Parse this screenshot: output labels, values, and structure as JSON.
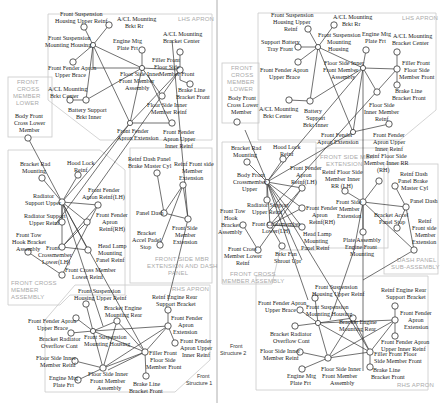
{
  "diagrams": [
    {
      "caption": [
        "Front",
        "Structure 1"
      ],
      "regions": {
        "lhs_apron": [
          "LHS APRON"
        ],
        "front_cross_member_lower": [
          "FRONT",
          "CROSS",
          "MEMBER",
          "LOWER"
        ],
        "front_cross_member_assembly": [
          "FRONT CROSS",
          "MEMBER",
          "ASSEMBLY"
        ],
        "front_side_mbr_ext_dash": [
          "FRONT SIDE MBR",
          "EXTENSION AND DASH",
          "PANEL"
        ],
        "rhs_apron": [
          "RHS APRON"
        ]
      },
      "nodes": [
        {
          "id": "a1",
          "label": [
            "Front Suspension",
            "Housing Upper Reinf"
          ]
        },
        {
          "id": "a2",
          "label": [
            "A/CL Mounting",
            "Brkt Rr"
          ]
        },
        {
          "id": "a3",
          "label": [
            "Front Suspension",
            "Mounting Housing"
          ]
        },
        {
          "id": "a4",
          "label": [
            "Engine Mtg",
            "Plate Frt"
          ]
        },
        {
          "id": "a5",
          "label": [
            "A/CL Mounting",
            "Bracket Center"
          ]
        },
        {
          "id": "a6",
          "label": [
            "Front Fender Apron",
            "Upper Brace"
          ]
        },
        {
          "id": "a7",
          "label": [
            "Filler Front",
            "Floor Side",
            "Member Front"
          ]
        },
        {
          "id": "a8",
          "label": [
            "Floor Side Inner",
            "Front Member",
            "Assembly"
          ]
        },
        {
          "id": "a9",
          "label": [
            "Brake Line",
            "Bracket Front"
          ]
        },
        {
          "id": "a10",
          "label": [
            "A/CL Mounting",
            "Brkt Center"
          ]
        },
        {
          "id": "a11",
          "label": [
            "Battery Support",
            "Brkt Inner"
          ]
        },
        {
          "id": "a12",
          "label": [
            "Floor Side Inner",
            "Member Reinf"
          ]
        },
        {
          "id": "a13",
          "label": [
            "Front Fender",
            "Apron Extension"
          ]
        },
        {
          "id": "a14",
          "label": [
            "Front Fender",
            "Apron Upper",
            "Inner Reinf"
          ]
        },
        {
          "id": "b1",
          "label": [
            "Body Front",
            "Cross Lower",
            "Member"
          ]
        },
        {
          "id": "c1",
          "label": [
            "Bracket Rad",
            "Mounting"
          ]
        },
        {
          "id": "c2",
          "label": [
            "Hood Lock",
            "Reinf"
          ]
        },
        {
          "id": "c3",
          "label": [
            "Radiator",
            "Support Upper"
          ]
        },
        {
          "id": "c4",
          "label": [
            "Front Fender",
            "Apron Reinf(LH)"
          ]
        },
        {
          "id": "c5",
          "label": [
            "Radiator Support",
            "Upper Reinf"
          ]
        },
        {
          "id": "c6",
          "label": [
            "Front Fender",
            "Apron",
            "Reinf(RH)"
          ]
        },
        {
          "id": "c7",
          "label": [
            "Front Tow",
            "Hook Bracket",
            "Assembly"
          ]
        },
        {
          "id": "c8",
          "label": [
            "Front",
            "Crossmember",
            "Lower(LH)"
          ]
        },
        {
          "id": "c9",
          "label": [
            "Head Lamp",
            "Mounting",
            "Panel Reinf"
          ]
        },
        {
          "id": "c10",
          "label": [
            "Front Cross Member",
            "Lower Reinf"
          ]
        },
        {
          "id": "d1",
          "label": [
            "Reinf Dash Panel",
            "Brake Master Cyl"
          ]
        },
        {
          "id": "d2",
          "label": [
            "Reinf Front side",
            "Member",
            "Extension"
          ]
        },
        {
          "id": "d3",
          "label": [
            "Panel Dash"
          ]
        },
        {
          "id": "d4",
          "label": [
            "Front Side",
            "Member",
            "Extension"
          ]
        },
        {
          "id": "d5",
          "label": [
            "Bracket",
            "Accel Padel",
            "Stop"
          ]
        },
        {
          "id": "e1",
          "label": [
            "Front Suspension",
            "Housing Upper Reinf"
          ]
        },
        {
          "id": "e2",
          "label": [
            "Reinf Engine Rear",
            "Support Bracket"
          ]
        },
        {
          "id": "e3",
          "label": [
            "Bracket Engine",
            "Mounting Rear"
          ]
        },
        {
          "id": "e4",
          "label": [
            "Front Fender Apron",
            "Upper Brace"
          ]
        },
        {
          "id": "e5",
          "label": [
            "Front Fender",
            "Apron",
            "Extension"
          ]
        },
        {
          "id": "e6",
          "label": [
            "Front Suspension",
            "Mounting Housing"
          ]
        },
        {
          "id": "e7",
          "label": [
            "Bracket Radiator",
            "Overflow Cont"
          ]
        },
        {
          "id": "e8",
          "label": [
            "Front Fender",
            "Apron Upper",
            "Inner Reinf"
          ]
        },
        {
          "id": "e9",
          "label": [
            "Floor Side Inner",
            "Member Reinf"
          ]
        },
        {
          "id": "e10",
          "label": [
            "Filler Front",
            "Floor Side",
            "Member Front"
          ]
        },
        {
          "id": "e11",
          "label": [
            "Engine Mtg",
            "Plate Frt"
          ]
        },
        {
          "id": "e12",
          "label": [
            "Floor Side Inner",
            "Front Member",
            "Assembly"
          ]
        },
        {
          "id": "e13",
          "label": [
            "Brake Line",
            "Bracket Front"
          ]
        }
      ]
    },
    {
      "caption": [
        "Front",
        "Structure 2"
      ],
      "regions": {
        "lhs_apron": [
          "LHS APRON"
        ],
        "front_cross_member_lower": [
          "FRONT",
          "CROSS",
          "MEMBER",
          "LOWER"
        ],
        "front_side_mbr_extension": [
          "FRONT SIDE MBR",
          "EXTENSION"
        ],
        "dash_panel_subassembly": [
          "DASH PANEL",
          "SUB-ASSEMBLY"
        ],
        "front_cross_member_assembly": [
          "FRONT CROSS",
          "MEMBER ASSEMBLY"
        ],
        "rhs_apron": [
          "RHS APRON"
        ]
      },
      "nodes": [
        {
          "id": "A1",
          "label": [
            "Front Suspension",
            "Housing Upper",
            "Reinf"
          ]
        },
        {
          "id": "A2",
          "label": [
            "A/CL Mounting",
            "Brkt Rr"
          ]
        },
        {
          "id": "A3",
          "label": [
            "Support Battery",
            "Tray Front"
          ]
        },
        {
          "id": "A4",
          "label": [
            "Front Suspension",
            "Mounting",
            "Housing"
          ]
        },
        {
          "id": "A5",
          "label": [
            "Engine Mtg",
            "Plate Frt"
          ]
        },
        {
          "id": "A6",
          "label": [
            "A/CL Mounting",
            "Bracket Center"
          ]
        },
        {
          "id": "A7",
          "label": [
            "Front Fender Apron",
            "Upper Brace"
          ]
        },
        {
          "id": "A8",
          "label": [
            "Floor Side Inner",
            "Front Member",
            "Assembly"
          ]
        },
        {
          "id": "A9",
          "label": [
            "Filler Front",
            "Floor Side",
            "Member Front"
          ]
        },
        {
          "id": "A10",
          "label": [
            "Brake Line",
            "Bracket Front"
          ]
        },
        {
          "id": "A11",
          "label": [
            "A/CL Mounting",
            "Brkt Center"
          ]
        },
        {
          "id": "A12",
          "label": [
            "Battery",
            "Support",
            "Brkt Inner"
          ]
        },
        {
          "id": "A13",
          "label": [
            "Floor Side",
            "Inner Member",
            "Reinf"
          ]
        },
        {
          "id": "A14",
          "label": [
            "Front Fender",
            "Apron Extension"
          ]
        },
        {
          "id": "A15",
          "label": [
            "Front Fender",
            "Apron Upper",
            "Inner Reinf"
          ]
        },
        {
          "id": "B1",
          "label": [
            "Body Front",
            "Cross Lower",
            "Member"
          ]
        },
        {
          "id": "C1",
          "label": [
            "Bracket Rad",
            "Mounting"
          ]
        },
        {
          "id": "C2",
          "label": [
            "Hood Lock",
            "Reinf"
          ]
        },
        {
          "id": "C3",
          "label": [
            "Body Front",
            "Crossmember",
            "Upper"
          ]
        },
        {
          "id": "C4",
          "label": [
            "Front Fender",
            "Apron",
            "Reinf(LH)"
          ]
        },
        {
          "id": "C5",
          "label": [
            "Radiator Support",
            "Upper Reinf"
          ]
        },
        {
          "id": "C6",
          "label": [
            "Front Fender",
            "Apron",
            "Reinf(RH)"
          ]
        },
        {
          "id": "C7",
          "label": [
            "Front Tow",
            "Hook",
            "Bracket",
            "Assembly"
          ]
        },
        {
          "id": "C8",
          "label": [
            "Front Crossmember",
            "Lower(LH)"
          ]
        },
        {
          "id": "C9",
          "label": [
            "Head Lamp",
            "Mounting",
            "Panel Reinf"
          ]
        },
        {
          "id": "C10",
          "label": [
            "Front Cross",
            "Member Lower",
            "Reinf"
          ]
        },
        {
          "id": "C11",
          "label": [
            "Brkr Fan",
            "Shrout Upr"
          ]
        },
        {
          "id": "D1",
          "label": [
            "Reinf Floor Side",
            "Member Inner",
            "RR (LH)"
          ]
        },
        {
          "id": "D2",
          "label": [
            "Reinf Floor Side",
            "Member Inner RR",
            "(RH)"
          ]
        },
        {
          "id": "D3",
          "label": [
            "Front Side",
            "Member",
            "Extension"
          ]
        },
        {
          "id": "D4",
          "label": [
            "Plate Assembly",
            "Engine Front",
            "Mounting"
          ]
        },
        {
          "id": "D5",
          "label": [
            "Reinf Dash",
            "Panel Brake",
            "Master Cyl"
          ]
        },
        {
          "id": "D6",
          "label": [
            "Panel Dash"
          ]
        },
        {
          "id": "D7",
          "label": [
            "Bracket Accel",
            "Panel Stop"
          ]
        },
        {
          "id": "D8",
          "label": [
            "Reinf",
            "Front side",
            "Member",
            "Extension"
          ]
        },
        {
          "id": "E1",
          "label": [
            "Front Suspension",
            "Housing Upper Reinf"
          ]
        },
        {
          "id": "E2",
          "label": [
            "Reinf Engine Rear",
            "Support Bracket"
          ]
        },
        {
          "id": "E3",
          "label": [
            "Front Fender Apron",
            "Upper Brace"
          ]
        },
        {
          "id": "E4",
          "label": [
            "Front Suspension",
            "Mounting Housing"
          ]
        },
        {
          "id": "E5",
          "label": [
            "Front Fender",
            "Apron",
            "Extension"
          ]
        },
        {
          "id": "E6",
          "label": [
            "Bracket Engine",
            "Mounting Rear"
          ]
        },
        {
          "id": "E7",
          "label": [
            "Bracket Radiator",
            "Overflow Cont"
          ]
        },
        {
          "id": "E8",
          "label": [
            "Front Fender Apron",
            "Upper Inner Reinf"
          ]
        },
        {
          "id": "E9",
          "label": [
            "Floor Side Inner",
            "Member Reinf"
          ]
        },
        {
          "id": "E10",
          "label": [
            "Filler Front Floor",
            "Side Member Front"
          ]
        },
        {
          "id": "E11",
          "label": [
            "Engine Mtg",
            "Plate Frt"
          ]
        },
        {
          "id": "E12",
          "label": [
            "Floor Side Inner",
            "Front Member",
            "Assembly"
          ]
        },
        {
          "id": "E13",
          "label": [
            "Brake Line",
            "Bracket Front"
          ]
        }
      ]
    }
  ],
  "colors": {
    "edge": "#333333",
    "region_border": "#c9c9c9",
    "region_label": "#aaaaaa",
    "divider": "#999999",
    "background": "#ffffff"
  }
}
